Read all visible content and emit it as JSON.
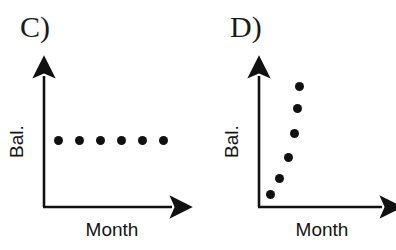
{
  "figure": {
    "width": 396,
    "height": 250,
    "background_color": "#ffffff",
    "ink_color": "#111111"
  },
  "panels": [
    {
      "id": "c",
      "label": "C)",
      "xlabel": "Month",
      "ylabel": "Bal."
    },
    {
      "id": "d",
      "label": "D)",
      "xlabel": "Month",
      "ylabel": "Bal."
    }
  ],
  "chart_data": [
    {
      "type": "scatter",
      "title": "C)",
      "xlabel": "Month",
      "ylabel": "Bal.",
      "grid": false,
      "legend": false,
      "axis_style": "arrow-headed L-shaped axes, no tick marks, no tick labels",
      "description": "Balance stays constant across months - six evenly spaced dots in a flat horizontal line",
      "x": [
        1,
        2,
        3,
        4,
        5,
        6
      ],
      "y": [
        1,
        1,
        1,
        1,
        1,
        1
      ],
      "xlim": [
        0,
        7
      ],
      "ylim": [
        0,
        2
      ],
      "marker": "filled-circle",
      "marker_color": "#111111",
      "pixel_points": [
        {
          "x": 58,
          "y": 140
        },
        {
          "x": 79,
          "y": 140
        },
        {
          "x": 100,
          "y": 140
        },
        {
          "x": 121,
          "y": 140
        },
        {
          "x": 142,
          "y": 140
        },
        {
          "x": 163,
          "y": 140
        }
      ]
    },
    {
      "type": "scatter",
      "title": "D)",
      "xlabel": "Month",
      "ylabel": "Bal.",
      "grid": false,
      "legend": false,
      "axis_style": "arrow-headed L-shaped axes, no tick marks, no tick labels",
      "description": "Balance rises very steeply in the earliest months - six dots climbing almost vertically and bending right near the top",
      "x": [
        1.0,
        1.3,
        1.75,
        2.3,
        2.6,
        2.7
      ],
      "y": [
        0.2,
        1.0,
        2.2,
        3.4,
        4.4,
        5.2
      ],
      "xlim": [
        0,
        7
      ],
      "ylim": [
        0,
        6
      ],
      "marker": "filled-circle",
      "marker_color": "#111111",
      "pixel_points": [
        {
          "x": 270,
          "y": 194
        },
        {
          "x": 279,
          "y": 178
        },
        {
          "x": 288,
          "y": 157
        },
        {
          "x": 294,
          "y": 133
        },
        {
          "x": 297,
          "y": 108
        },
        {
          "x": 299,
          "y": 86
        }
      ]
    }
  ]
}
